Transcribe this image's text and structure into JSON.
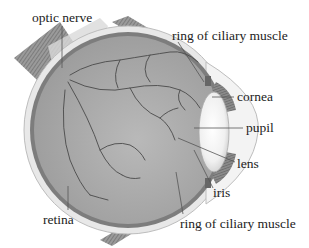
{
  "diagram": {
    "labels": {
      "optic_nerve": "optic nerve",
      "ciliary_top": "ring of ciliary muscle",
      "cornea": "cornea",
      "pupil": "pupil",
      "lens": "lens",
      "iris": "iris",
      "retina": "retina",
      "ciliary_bottom": "ring of ciliary muscle"
    },
    "colors": {
      "background": "#ffffff",
      "vitreous": "#a9a9a9",
      "sclera": "#e6e6e6",
      "choroid": "#7d7d7d",
      "lens": "#f4f4f4",
      "muscle": "#8a8a8a",
      "text": "#222222"
    }
  }
}
